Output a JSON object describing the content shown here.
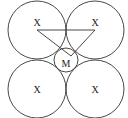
{
  "diagram": {
    "large_circles": [
      {
        "cx": 37,
        "cy": 30,
        "r": 29,
        "label": "X",
        "lx": 37,
        "ly": 26
      },
      {
        "cx": 95,
        "cy": 30,
        "r": 29,
        "label": "X",
        "lx": 95,
        "ly": 26
      },
      {
        "cx": 37,
        "cy": 89,
        "r": 29,
        "label": "X",
        "lx": 37,
        "ly": 93
      },
      {
        "cx": 95,
        "cy": 89,
        "r": 29,
        "label": "X",
        "lx": 95,
        "ly": 93
      }
    ],
    "center_circle": {
      "cx": 66,
      "cy": 60,
      "r": 12,
      "label": "M",
      "lx": 66,
      "ly": 67
    },
    "triangle": {
      "points": "37,30 95,30 71,56"
    },
    "stroke_color": "#333333"
  }
}
